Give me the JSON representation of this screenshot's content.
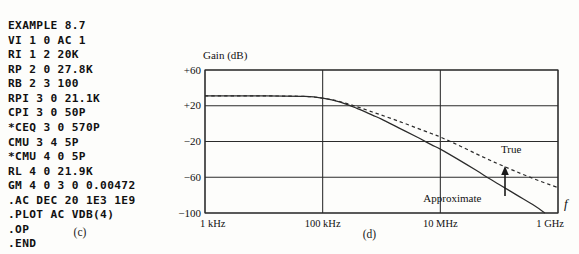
{
  "figure": {
    "panel_c": {
      "caption": "(c)",
      "netlist_lines": [
        "EXAMPLE 8.7",
        "VI 1 0 AC 1",
        "RI 1 2 20K",
        "RP 2 0 27.8K",
        "RB 2 3 100",
        "RPI 3 0 21.1K",
        "CPI 3 0 50P",
        "*CEQ 3 0 570P",
        "CMU 3 4 5P",
        "*CMU 4 0 5P",
        "RL 4 0 21.9K",
        "GM 4 0 3 0 0.00472",
        ".AC DEC 20 1E3 1E9",
        ".PLOT AC VDB(4)",
        ".OP",
        ".END"
      ]
    },
    "panel_d": {
      "caption": "(d)"
    }
  },
  "chart_data": {
    "type": "line",
    "title": "",
    "ylabel": "Gain (dB)",
    "xlabel": "f",
    "x_scale": "log",
    "xlim": [
      1000,
      1000000000
    ],
    "ylim": [
      -100,
      60
    ],
    "yticks": [
      60,
      20,
      -20,
      -60,
      -100
    ],
    "ytick_labels": [
      "+60",
      "+20",
      "−20",
      "−60",
      "−100"
    ],
    "xticks": [
      1000,
      100000,
      10000000,
      1000000000
    ],
    "xtick_labels": [
      "1 kHz",
      "100 kHz",
      "10 MHz",
      "1 GHz"
    ],
    "grid": true,
    "legend_position": "inline-annotations",
    "annotations": [
      {
        "name": "true-label",
        "text": "True",
        "x_hz": 160000000,
        "y_db": -33
      },
      {
        "name": "approximate-label",
        "text": "Approximate",
        "x_hz": 16000000,
        "y_db": -88
      },
      {
        "name": "pointer-arrow",
        "text": "",
        "x_hz": 260000000,
        "y_db": -75
      }
    ],
    "series": [
      {
        "name": "True",
        "style": "dashed",
        "color": "#1a1a1a",
        "points_hz_db": [
          [
            1000,
            31
          ],
          [
            10000,
            31
          ],
          [
            50000,
            30.4
          ],
          [
            100000,
            28.5
          ],
          [
            200000,
            24.5
          ],
          [
            400000,
            18.5
          ],
          [
            700000,
            13.0
          ],
          [
            1000000,
            9.5
          ],
          [
            2000000,
            2.5
          ],
          [
            4000000,
            -5.0
          ],
          [
            7000000,
            -11.0
          ],
          [
            10000000,
            -15.0
          ],
          [
            20000000,
            -24.0
          ],
          [
            40000000,
            -33.5
          ],
          [
            70000000,
            -41.0
          ],
          [
            100000000,
            -45.5
          ],
          [
            200000000,
            -54.0
          ],
          [
            400000000,
            -62.0
          ],
          [
            700000000,
            -68.0
          ],
          [
            1000000000,
            -71.5
          ]
        ]
      },
      {
        "name": "Approximate",
        "style": "solid",
        "color": "#1a1a1a",
        "points_hz_db": [
          [
            1000,
            31
          ],
          [
            10000,
            31
          ],
          [
            50000,
            30.4
          ],
          [
            100000,
            28.5
          ],
          [
            200000,
            24.0
          ],
          [
            400000,
            16.5
          ],
          [
            700000,
            9.5
          ],
          [
            1000000,
            5.0
          ],
          [
            2000000,
            -5.0
          ],
          [
            4000000,
            -15.0
          ],
          [
            7000000,
            -23.5
          ],
          [
            10000000,
            -28.5
          ],
          [
            20000000,
            -40.0
          ],
          [
            40000000,
            -52.0
          ],
          [
            70000000,
            -62.0
          ],
          [
            100000000,
            -68.0
          ],
          [
            200000000,
            -80.0
          ],
          [
            400000000,
            -92.0
          ],
          [
            600000000,
            -100.0
          ]
        ]
      }
    ]
  }
}
